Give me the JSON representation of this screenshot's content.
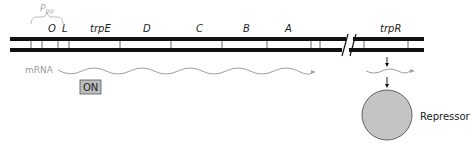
{
  "diagram": {
    "promoter": {
      "label": "P",
      "subscript": "trp"
    },
    "operator": {
      "label": "O"
    },
    "leader": {
      "label": "L"
    },
    "genes": [
      {
        "label": "trpE"
      },
      {
        "label": "D"
      },
      {
        "label": "C"
      },
      {
        "label": "B"
      },
      {
        "label": "A"
      }
    ],
    "regulator_gene": {
      "label": "trpR"
    },
    "mrna": {
      "label": "mRNA"
    },
    "status_badge": {
      "label": "ON"
    },
    "repressor": {
      "label": "Repressor"
    },
    "colors": {
      "dna": "#111111",
      "mrna": "#a0a0a0",
      "promoter_bracket": "#bbbbbb",
      "badge_fill": "#bdbdbd",
      "repressor_fill": "#c4c4c4",
      "repressor_stroke": "#555555"
    }
  }
}
